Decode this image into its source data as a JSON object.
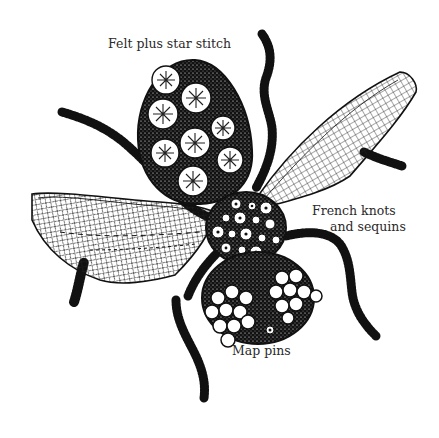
{
  "figure": {
    "colors": {
      "ink": "#111111",
      "paper": "#ffffff",
      "label_text": "#2a2a2a"
    }
  },
  "labels": {
    "abdomen": "Felt plus star stitch",
    "thorax_line1": "French knots",
    "thorax_line2": "and sequins",
    "head": "Map pins"
  },
  "parts": {
    "abdomen": {
      "technique": "felt discs with star stitch",
      "disc_count": 9
    },
    "thorax": {
      "technique": "french knots and sequins"
    },
    "head": {
      "technique": "map pins",
      "eye_clusters": 2
    },
    "wings": {
      "count": 2,
      "technique": "net mesh"
    },
    "legs": {
      "count": 6,
      "technique": "chenille / pipe cleaner"
    }
  }
}
